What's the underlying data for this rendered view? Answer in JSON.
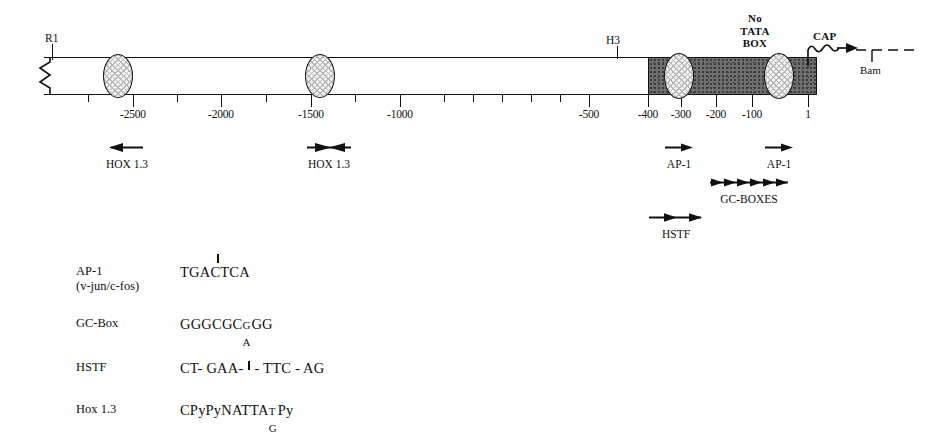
{
  "figure": {
    "type": "gene-promoter-map",
    "title": "",
    "colors": {
      "line": "#111111",
      "coding_fill": "#6f6f6f",
      "ellipse_fill": "#f2f2f2",
      "background": "#fefefe"
    }
  },
  "map": {
    "restriction_sites": [
      {
        "name": "R1",
        "label": "R1",
        "x": 52,
        "label_x": 45,
        "label_y": 38
      },
      {
        "name": "H3",
        "label": "H3",
        "x": 617,
        "label_x": 607,
        "label_y": 44
      },
      {
        "name": "Bam",
        "label": "Bam",
        "x": 872,
        "label_x": 861,
        "label_y": 68
      }
    ],
    "cap_label": "CAP",
    "no_tata_label": [
      "No",
      "TATA",
      "BOX"
    ],
    "axis": {
      "major_ticks": [
        {
          "value": "-2500",
          "x": 133
        },
        {
          "value": "-2000",
          "x": 221
        },
        {
          "value": "-1500",
          "x": 311
        },
        {
          "value": "-1000",
          "x": 400
        },
        {
          "value": "-500",
          "x": 589
        },
        {
          "value": "-400",
          "x": 648
        },
        {
          "value": "-300",
          "x": 681
        },
        {
          "value": "-200",
          "x": 716
        },
        {
          "value": "-100",
          "x": 752
        },
        {
          "value": "1",
          "x": 808
        }
      ],
      "minor_tick_xs": [
        88,
        177,
        266,
        355,
        444,
        473,
        502,
        531,
        560
      ]
    },
    "binding_ellipses": [
      {
        "name": "hox-site-2500",
        "cx": 118,
        "cy": 76,
        "rx": 15,
        "ry": 22
      },
      {
        "name": "hox-site-1500",
        "cx": 320,
        "cy": 76,
        "rx": 15,
        "ry": 22
      },
      {
        "name": "ap1-site-300",
        "cx": 679,
        "cy": 76,
        "rx": 15,
        "ry": 23
      },
      {
        "name": "ap1-site-80",
        "cx": 779,
        "cy": 76,
        "rx": 15,
        "ry": 23
      }
    ],
    "features": [
      {
        "name": "hox-1-3-left",
        "label": "HOX 1.3",
        "x": 91,
        "width": 72,
        "arrow": "left",
        "row_y": 139
      },
      {
        "name": "hox-1-3-right",
        "label": "HOX 1.3",
        "x": 293,
        "width": 72,
        "arrow": "converge",
        "row_y": 139
      },
      {
        "name": "ap-1-left",
        "label": "AP-1",
        "x": 655,
        "width": 48,
        "arrow": "right",
        "row_y": 139
      },
      {
        "name": "ap-1-right",
        "label": "AP-1",
        "x": 755,
        "width": 48,
        "arrow": "right",
        "row_y": 139
      },
      {
        "name": "gc-boxes",
        "label": "GC-BOXES",
        "x": 706,
        "width": 82,
        "arrow": "multi6",
        "row_y": 174
      },
      {
        "name": "hstf",
        "label": "HSTF",
        "x": 645,
        "width": 62,
        "arrow": "double",
        "row_y": 209
      }
    ]
  },
  "legend": {
    "rows": [
      {
        "name": "AP-1",
        "subname": "(v-jun/c-fos)",
        "sequence": "TGACTCA",
        "tick": {
          "show": true,
          "after_char": 4
        }
      },
      {
        "name": "GC-Box",
        "subname": "",
        "sequence_prefix": "GGGCGC",
        "stack": {
          "up": "G",
          "dn": "A"
        },
        "sequence_suffix": "GG",
        "tick": {
          "show": false
        }
      },
      {
        "name": "HSTF",
        "subname": "",
        "sequence_prefix": "CT- GAA-",
        "sequence_suffix": "- TTC - AG",
        "tick": {
          "show": true
        }
      },
      {
        "name": "Hox 1.3",
        "subname": "",
        "sequence_prefix": "CPyPyNATTA",
        "stack": {
          "up": "T",
          "dn": "G"
        },
        "sequence_suffix": "Py",
        "tick": {
          "show": false
        }
      }
    ]
  }
}
